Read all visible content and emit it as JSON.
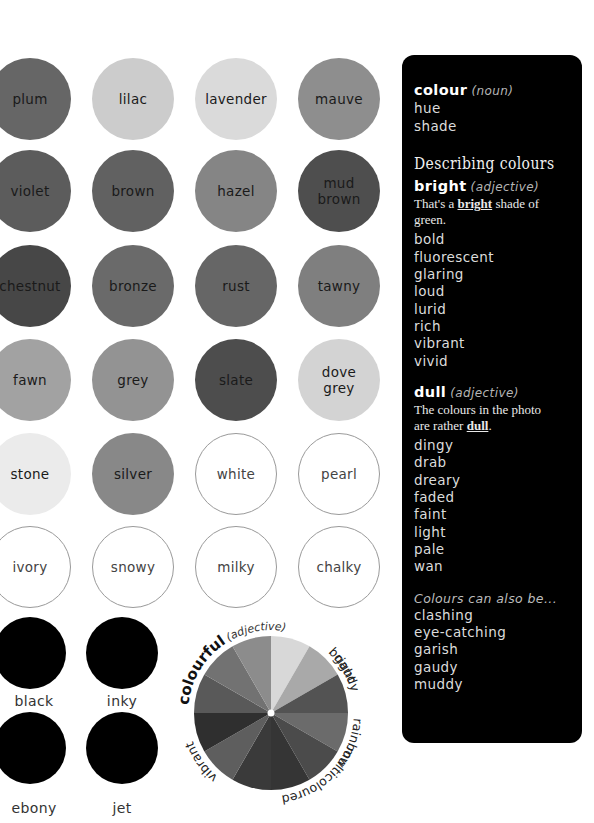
{
  "swatches": {
    "row1": [
      {
        "label": "plum",
        "color": "#666666"
      },
      {
        "label": "lilac",
        "color": "#cccccc"
      },
      {
        "label": "lavender",
        "color": "#dadada"
      },
      {
        "label": "mauve",
        "color": "#8e8e8e"
      }
    ],
    "row2": [
      {
        "label": "violet",
        "color": "#5c5c5c"
      },
      {
        "label": "brown",
        "color": "#616161"
      },
      {
        "label": "hazel",
        "color": "#858585"
      },
      {
        "label": "mud\nbrown",
        "color": "#4e4e4e"
      }
    ],
    "row3": [
      {
        "label": "chestnut",
        "color": "#474747"
      },
      {
        "label": "bronze",
        "color": "#6a6a6a"
      },
      {
        "label": "rust",
        "color": "#666666"
      },
      {
        "label": "tawny",
        "color": "#7f7f7f"
      }
    ],
    "row4": [
      {
        "label": "fawn",
        "color": "#a2a2a2"
      },
      {
        "label": "grey",
        "color": "#939393"
      },
      {
        "label": "slate",
        "color": "#4d4d4d"
      },
      {
        "label": "dove\ngrey",
        "color": "#d3d3d3"
      }
    ],
    "row5": [
      {
        "label": "stone",
        "color": "#ebebeb"
      },
      {
        "label": "silver",
        "color": "#888888"
      },
      {
        "label": "white",
        "color": "#ffffff"
      },
      {
        "label": "pearl",
        "color": "#ffffff"
      }
    ],
    "row6": [
      {
        "label": "ivory",
        "color": "#ffffff"
      },
      {
        "label": "snowy",
        "color": "#ffffff"
      },
      {
        "label": "milky",
        "color": "#ffffff"
      },
      {
        "label": "chalky",
        "color": "#ffffff"
      }
    ],
    "blacks": [
      {
        "label": "black",
        "color": "#000000"
      },
      {
        "label": "inky",
        "color": "#000000"
      },
      {
        "label": "ebony",
        "color": "#000000"
      },
      {
        "label": "jet",
        "color": "#000000"
      }
    ]
  },
  "wheel": {
    "headword": "colourful",
    "pos": "(adjective)",
    "synonyms": [
      "bright",
      "gaudy",
      "rainbow",
      "multicoloured",
      "vibrant"
    ],
    "segment_colors": [
      "#d8d8d8",
      "#a9a9a9",
      "#535353",
      "#6b6b6b",
      "#4b4b4b",
      "#353535",
      "#3a3a3a",
      "#5e5e5e",
      "#2f2f2f",
      "#595959",
      "#727272",
      "#8c8c8c"
    ]
  },
  "panel": {
    "colour": {
      "head": "colour",
      "pos": "(noun)",
      "items": [
        "hue",
        "shade"
      ]
    },
    "title": "Describing colours",
    "bright": {
      "head": "bright",
      "pos": "(adjective)",
      "example_pre": "That's a ",
      "example_word": "bright",
      "example_post": " shade of green.",
      "items": [
        "bold",
        "fluorescent",
        "glaring",
        "loud",
        "lurid",
        "rich",
        "vibrant",
        "vivid"
      ]
    },
    "dull": {
      "head": "dull",
      "pos": "(adjective)",
      "example_line1": "The colours in the photo",
      "example_pre": "are rather ",
      "example_word": "dull",
      "example_post": ".",
      "items": [
        "dingy",
        "drab",
        "dreary",
        "faded",
        "faint",
        "light",
        "pale",
        "wan"
      ]
    },
    "also": {
      "intro": "Colours can also be...",
      "items": [
        "clashing",
        "eye-catching",
        "garish",
        "gaudy",
        "muddy"
      ]
    }
  }
}
